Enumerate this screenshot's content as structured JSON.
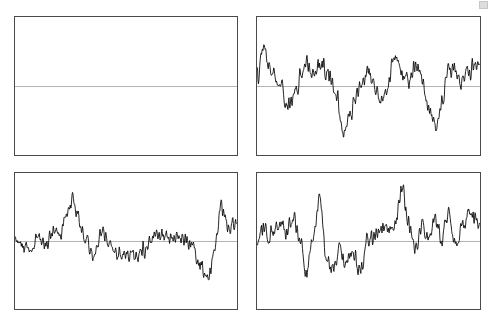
{
  "figure": {
    "title": "",
    "background_color": "#ffffff",
    "width": 494,
    "height": 325,
    "frame_color": "#4a4a4a",
    "trace_color": "#000000",
    "zero_line_color": "#b4b4b4",
    "layout": "2x2-grid-of-timeseries-panels",
    "corner_artifact_label": "scan-artifact"
  },
  "chart_data": {
    "type": "line",
    "title": "",
    "xlabel": "",
    "ylabel": "",
    "grid": false,
    "legend": "none",
    "axis_ticks": "none",
    "panel_count": 4,
    "shared_ylim": [
      -1,
      1
    ],
    "shared_xlim": [
      0,
      1
    ],
    "panels": [
      {
        "id": "panel-top-left",
        "position": "top-left",
        "label": "",
        "x": 14,
        "y": 16,
        "width": 224,
        "height": 140,
        "zero_line": true,
        "zero_line_y_fraction": 0.5,
        "series": [],
        "note": "empty panel - frame and zero line only, no data trace"
      },
      {
        "id": "panel-top-right",
        "position": "top-right",
        "label": "",
        "x": 256,
        "y": 16,
        "width": 225,
        "height": 140,
        "zero_line": true,
        "zero_line_y_fraction": 0.5,
        "seed": 10713,
        "noise_amplitude": 0.26,
        "smoothing": 2,
        "series": [
          {
            "name": "trace-top-right",
            "envelope_x": [
              0.0,
              0.03,
              0.06,
              0.1,
              0.13,
              0.17,
              0.21,
              0.25,
              0.29,
              0.33,
              0.36,
              0.38,
              0.41,
              0.44,
              0.47,
              0.5,
              0.53,
              0.56,
              0.59,
              0.62,
              0.65,
              0.68,
              0.71,
              0.74,
              0.77,
              0.8,
              0.83,
              0.86,
              0.89,
              0.92,
              0.95,
              1.0
            ],
            "envelope_y": [
              0.18,
              0.62,
              0.3,
              0.1,
              -0.3,
              -0.1,
              0.36,
              0.3,
              0.4,
              0.18,
              -0.2,
              -0.82,
              -0.55,
              -0.28,
              0.12,
              0.3,
              -0.05,
              -0.3,
              0.1,
              0.55,
              0.22,
              0.05,
              0.4,
              0.18,
              -0.38,
              -0.72,
              -0.3,
              0.18,
              0.32,
              0.05,
              0.3,
              0.4
            ]
          }
        ]
      },
      {
        "id": "panel-bottom-left",
        "position": "bottom-left",
        "label": "",
        "x": 14,
        "y": 172,
        "width": 224,
        "height": 138,
        "zero_line": true,
        "zero_line_y_fraction": 0.5,
        "seed": 44219,
        "noise_amplitude": 0.22,
        "smoothing": 2,
        "series": [
          {
            "name": "trace-bottom-left",
            "envelope_x": [
              0.0,
              0.03,
              0.07,
              0.1,
              0.14,
              0.17,
              0.2,
              0.23,
              0.26,
              0.29,
              0.32,
              0.35,
              0.39,
              0.43,
              0.47,
              0.51,
              0.55,
              0.59,
              0.63,
              0.67,
              0.71,
              0.75,
              0.79,
              0.83,
              0.87,
              0.9,
              0.93,
              0.96,
              1.0
            ],
            "envelope_y": [
              0.02,
              -0.1,
              -0.22,
              0.05,
              -0.05,
              0.28,
              0.1,
              0.45,
              0.78,
              0.4,
              0.0,
              -0.3,
              0.16,
              -0.08,
              -0.26,
              -0.22,
              -0.3,
              -0.12,
              0.06,
              0.14,
              0.02,
              0.08,
              -0.05,
              -0.38,
              -0.6,
              -0.2,
              0.65,
              0.25,
              0.3
            ]
          }
        ]
      },
      {
        "id": "panel-bottom-right",
        "position": "bottom-right",
        "label": "",
        "x": 256,
        "y": 172,
        "width": 225,
        "height": 138,
        "zero_line": true,
        "zero_line_y_fraction": 0.5,
        "seed": 90517,
        "noise_amplitude": 0.23,
        "smoothing": 2,
        "series": [
          {
            "name": "trace-bottom-right",
            "envelope_x": [
              0.0,
              0.03,
              0.06,
              0.1,
              0.13,
              0.16,
              0.19,
              0.22,
              0.25,
              0.28,
              0.31,
              0.34,
              0.37,
              0.4,
              0.43,
              0.46,
              0.5,
              0.54,
              0.58,
              0.62,
              0.65,
              0.68,
              0.71,
              0.74,
              0.77,
              0.8,
              0.83,
              0.86,
              0.89,
              0.92,
              0.95,
              1.0
            ],
            "envelope_y": [
              0.05,
              0.22,
              0.1,
              0.34,
              0.18,
              0.4,
              0.05,
              -0.58,
              0.1,
              0.72,
              -0.3,
              -0.52,
              -0.18,
              -0.4,
              -0.2,
              -0.5,
              0.05,
              0.12,
              0.28,
              0.2,
              0.95,
              0.3,
              -0.1,
              0.3,
              0.05,
              0.34,
              0.1,
              0.52,
              0.0,
              0.25,
              0.48,
              0.35
            ]
          }
        ]
      }
    ]
  }
}
